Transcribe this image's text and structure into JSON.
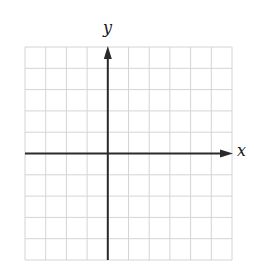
{
  "chart_data": {
    "type": "coordinate-grid",
    "title": "",
    "xlabel": "x",
    "ylabel": "y",
    "grid": true,
    "grid_columns": 10,
    "grid_rows": 10,
    "xlim": [
      -4,
      6
    ],
    "ylim": [
      -5,
      5
    ],
    "x_axis_arrow": "right",
    "y_axis_arrow": "up",
    "tick_labels": false,
    "series": []
  },
  "colors": {
    "grid_line": "#d4d4d4",
    "axis_line": "#2a2a2a",
    "background": "#ffffff"
  },
  "labels": {
    "x_axis": "x",
    "y_axis": "y"
  }
}
